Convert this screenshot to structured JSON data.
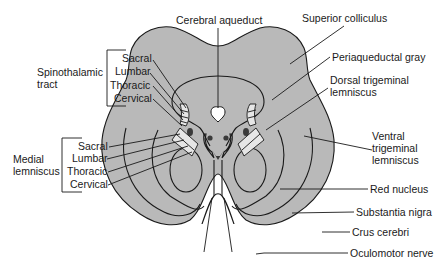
{
  "figure": {
    "colors": {
      "tissue": "#b9b9b9",
      "line": "#1a1a1a",
      "background": "#ffffff",
      "lemniscus_highlight": "#e6e6e6"
    }
  },
  "labels": {
    "cerebral_aqueduct": "Cerebral aqueduct",
    "superior_colliculus": "Superior colliculus",
    "periaqueductal_gray": "Periaqueductal gray",
    "dorsal_trigeminal_1": "Dorsal trigeminal",
    "dorsal_trigeminal_2": "lemniscus",
    "ventral_trigeminal_1": "Ventral",
    "ventral_trigeminal_2": "trigeminal",
    "ventral_trigeminal_3": "lemniscus",
    "red_nucleus": "Red nucleus",
    "substantia_nigra": "Substantia nigra",
    "crus_cerebri": "Crus cerebri",
    "oculomotor_nerve": "Oculomotor nerve"
  },
  "groups": {
    "spinothalamic": {
      "title_1": "Spinothalamic",
      "title_2": "tract",
      "items": [
        "Sacral",
        "Lumbar",
        "Thoracic",
        "Cervical"
      ]
    },
    "medial_lemniscus": {
      "title_1": "Medial",
      "title_2": "lemniscus",
      "items": [
        "Sacral",
        "Lumbar",
        "Thoracic",
        "Cervical"
      ]
    }
  }
}
